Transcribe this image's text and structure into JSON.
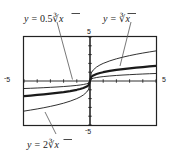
{
  "figure": {
    "title": "",
    "labels": {
      "curve_a": {
        "lhs": "y",
        "eq": "=",
        "coef": "0.5",
        "radical": "∛",
        "arg": "x",
        "full": "y = 0.5∛x"
      },
      "curve_b": {
        "lhs": "y",
        "eq": "=",
        "coef": "",
        "radical": "∛",
        "arg": "x",
        "full": "y = ∛x"
      },
      "curve_c": {
        "lhs": "y",
        "eq": "=",
        "coef": "2",
        "radical": "∛",
        "arg": "x",
        "full": "y = 2∛x"
      }
    },
    "axis_labels": {
      "left": "-5",
      "right": "5",
      "top": "5",
      "bottom": "-5",
      "left_sign": "-",
      "left_value": "5",
      "bottom_sign": "-",
      "bottom_value": "5"
    },
    "colors": {
      "ink": "#1a1a1a",
      "frame": "#222222",
      "background": "#ffffff",
      "leader": "#555555"
    }
  },
  "chart_data": {
    "type": "line",
    "title": "",
    "xlabel": "",
    "ylabel": "",
    "xlim": [
      -5,
      5
    ],
    "ylim": [
      -5,
      5
    ],
    "xticks": [
      -5,
      -4,
      -3,
      -2,
      -1,
      0,
      1,
      2,
      3,
      4,
      5
    ],
    "yticks": [
      -5,
      -4,
      -3,
      -2,
      -1,
      0,
      1,
      2,
      3,
      4,
      5
    ],
    "grid": false,
    "legend": "annotations-with-leader-lines",
    "tick_labels_shown": [
      "-5",
      "5",
      "5",
      "-5"
    ],
    "series": [
      {
        "name": "y = 0.5∛x",
        "expression": "0.5 * cbrt(x)",
        "coefficient": 0.5,
        "style": "thin",
        "x": [
          -5,
          -4.5,
          -4,
          -3.5,
          -3,
          -2.5,
          -2,
          -1.5,
          -1,
          -0.75,
          -0.5,
          -0.25,
          -0.1,
          0,
          0.1,
          0.25,
          0.5,
          0.75,
          1,
          1.5,
          2,
          2.5,
          3,
          3.5,
          4,
          4.5,
          5
        ],
        "y": [
          -0.855,
          -0.827,
          -0.794,
          -0.759,
          -0.721,
          -0.679,
          -0.63,
          -0.572,
          -0.5,
          -0.455,
          -0.397,
          -0.315,
          -0.232,
          0,
          0.232,
          0.315,
          0.397,
          0.455,
          0.5,
          0.572,
          0.63,
          0.679,
          0.721,
          0.759,
          0.794,
          0.827,
          0.855
        ]
      },
      {
        "name": "y = ∛x",
        "expression": "cbrt(x)",
        "coefficient": 1,
        "style": "thick",
        "x": [
          -5,
          -4.5,
          -4,
          -3.5,
          -3,
          -2.5,
          -2,
          -1.5,
          -1,
          -0.75,
          -0.5,
          -0.25,
          -0.1,
          0,
          0.1,
          0.25,
          0.5,
          0.75,
          1,
          1.5,
          2,
          2.5,
          3,
          3.5,
          4,
          4.5,
          5
        ],
        "y": [
          -1.71,
          -1.651,
          -1.587,
          -1.518,
          -1.442,
          -1.357,
          -1.26,
          -1.145,
          -1,
          -0.909,
          -0.794,
          -0.63,
          -0.464,
          0,
          0.464,
          0.63,
          0.794,
          0.909,
          1,
          1.145,
          1.26,
          1.357,
          1.442,
          1.518,
          1.587,
          1.651,
          1.71
        ]
      },
      {
        "name": "y = 2∛x",
        "expression": "2 * cbrt(x)",
        "coefficient": 2,
        "style": "thin",
        "x": [
          -5,
          -4.5,
          -4,
          -3.5,
          -3,
          -2.5,
          -2,
          -1.5,
          -1,
          -0.75,
          -0.5,
          -0.25,
          -0.1,
          0,
          0.1,
          0.25,
          0.5,
          0.75,
          1,
          1.5,
          2,
          2.5,
          3,
          3.5,
          4,
          4.5,
          5
        ],
        "y": [
          -3.42,
          -3.302,
          -3.175,
          -3.037,
          -2.884,
          -2.714,
          -2.52,
          -2.289,
          -2,
          -1.817,
          -1.587,
          -1.26,
          -0.928,
          0,
          0.928,
          1.26,
          1.587,
          1.817,
          2,
          2.289,
          2.52,
          2.714,
          2.884,
          3.037,
          3.175,
          3.302,
          3.42
        ]
      }
    ]
  }
}
